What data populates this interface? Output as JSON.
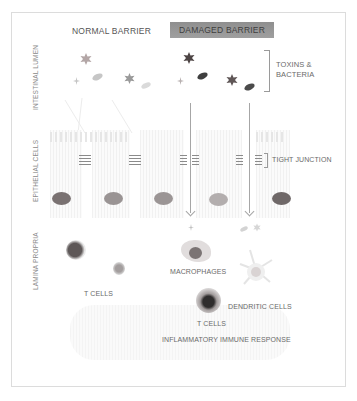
{
  "headers": {
    "normal": "NORMAL BARRIER",
    "damaged": "DAMAGED BARRIER"
  },
  "regions": {
    "lumen": "INTESTINAL LUMEN",
    "epithelial": "EPITHELIAL CELLS",
    "lamina": "LAMINA PROPRIA"
  },
  "annotations": {
    "toxins_line1": "TOXINS &",
    "toxins_line2": "BACTERIA",
    "tight_junction": "TIGHT JUNCTION",
    "macrophages": "MACROPHAGES",
    "tcells_left": "T CELLS",
    "dendritic": "DENDRITIC CELLS",
    "tcells_center": "T CELLS",
    "response": "INFLAMMATORY IMMUNE RESPONSE"
  },
  "colors": {
    "damaged_header_bg": "#959595",
    "nucleus_dark": "#6f6f6f",
    "nucleus_light": "#9a9a9a",
    "toxin": "#7d7d7d",
    "bacteria": "#4a4a4a",
    "frame_border": "#dcdcdc"
  }
}
